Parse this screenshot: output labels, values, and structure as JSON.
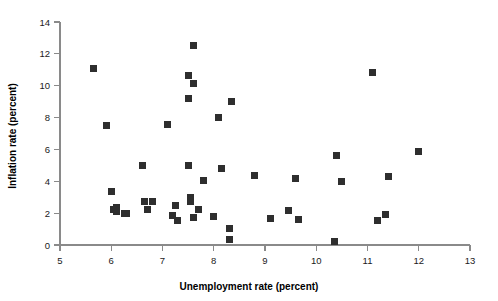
{
  "chart_data": {
    "type": "scatter",
    "title": "",
    "xlabel": "Unemployment rate (percent)",
    "ylabel": "Inflation rate (percent)",
    "xlim": [
      5,
      13
    ],
    "ylim": [
      0,
      14
    ],
    "xticks": [
      5,
      6,
      7,
      8,
      9,
      10,
      11,
      12,
      13
    ],
    "yticks": [
      0,
      2,
      4,
      6,
      8,
      10,
      12,
      14
    ],
    "xtick_labels": [
      "5",
      "6",
      "7",
      "8",
      "9",
      "10",
      "11",
      "12",
      "13"
    ],
    "ytick_labels": [
      "0",
      "2",
      "4",
      "6",
      "8",
      "10",
      "12",
      "14"
    ],
    "grid": false,
    "legend": null,
    "marker": "square",
    "marker_color": "#2e2e2e",
    "marker_size": 7,
    "points": [
      {
        "x": 5.65,
        "y": 11.05
      },
      {
        "x": 5.9,
        "y": 7.5
      },
      {
        "x": 6.0,
        "y": 3.35
      },
      {
        "x": 6.05,
        "y": 2.2
      },
      {
        "x": 6.1,
        "y": 2.35
      },
      {
        "x": 6.1,
        "y": 2.1
      },
      {
        "x": 6.25,
        "y": 2.0
      },
      {
        "x": 6.3,
        "y": 2.0
      },
      {
        "x": 6.6,
        "y": 5.0
      },
      {
        "x": 6.65,
        "y": 2.7
      },
      {
        "x": 6.7,
        "y": 2.25
      },
      {
        "x": 6.8,
        "y": 2.7
      },
      {
        "x": 7.1,
        "y": 7.55
      },
      {
        "x": 7.2,
        "y": 1.85
      },
      {
        "x": 7.25,
        "y": 2.5
      },
      {
        "x": 7.3,
        "y": 1.55
      },
      {
        "x": 7.5,
        "y": 10.65
      },
      {
        "x": 7.5,
        "y": 9.2
      },
      {
        "x": 7.5,
        "y": 5.0
      },
      {
        "x": 7.55,
        "y": 3.0
      },
      {
        "x": 7.55,
        "y": 2.75
      },
      {
        "x": 7.6,
        "y": 12.5
      },
      {
        "x": 7.6,
        "y": 10.15
      },
      {
        "x": 7.6,
        "y": 1.75
      },
      {
        "x": 7.7,
        "y": 2.25
      },
      {
        "x": 7.8,
        "y": 4.05
      },
      {
        "x": 8.0,
        "y": 1.8
      },
      {
        "x": 8.1,
        "y": 8.0
      },
      {
        "x": 8.15,
        "y": 4.8
      },
      {
        "x": 8.3,
        "y": 1.05
      },
      {
        "x": 8.3,
        "y": 0.35
      },
      {
        "x": 8.35,
        "y": 9.0
      },
      {
        "x": 8.8,
        "y": 4.35
      },
      {
        "x": 9.1,
        "y": 1.65
      },
      {
        "x": 9.45,
        "y": 2.15
      },
      {
        "x": 9.6,
        "y": 4.2
      },
      {
        "x": 9.65,
        "y": 1.6
      },
      {
        "x": 10.35,
        "y": 0.25
      },
      {
        "x": 10.4,
        "y": 5.65
      },
      {
        "x": 10.5,
        "y": 4.0
      },
      {
        "x": 11.1,
        "y": 10.8
      },
      {
        "x": 11.2,
        "y": 1.55
      },
      {
        "x": 11.35,
        "y": 1.9
      },
      {
        "x": 11.4,
        "y": 4.3
      },
      {
        "x": 12.0,
        "y": 5.9
      }
    ]
  }
}
